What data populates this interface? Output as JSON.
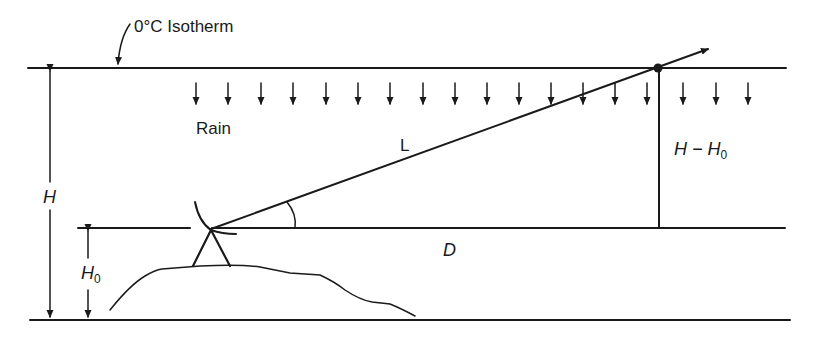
{
  "diagram": {
    "colors": {
      "ink": "#1a1a1a",
      "background": "#ffffff"
    },
    "labels": {
      "isotherm": "0°C Isotherm",
      "rain": "Rain",
      "path_length": "L",
      "height_total": "H",
      "height_antenna": "H",
      "height_antenna_sub": "0",
      "height_diff_main": "H − H",
      "height_diff_sub": "0",
      "distance": "D"
    },
    "lines": {
      "isotherm_y": 68,
      "antenna_level_y": 228,
      "ground_y": 320
    },
    "rain_arrows_count": 18,
    "icons": [
      "down-arrow-icon",
      "radar-dish-icon",
      "tripod-icon",
      "beam-arrow-icon"
    ]
  }
}
